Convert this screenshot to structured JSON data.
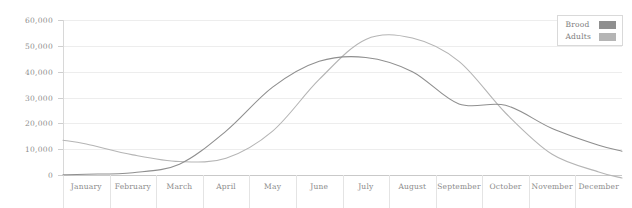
{
  "chart_data": {
    "type": "line",
    "title": "",
    "xlabel": "",
    "ylabel": "",
    "categories": [
      "January",
      "February",
      "March",
      "April",
      "May",
      "June",
      "July",
      "August",
      "September",
      "October",
      "November",
      "December"
    ],
    "ylim": [
      0,
      60000
    ],
    "ytick_labels": [
      "60,000",
      "50,000",
      "40,000",
      "30,000",
      "20,000",
      "10,000",
      "0"
    ],
    "ytick_values": [
      60000,
      50000,
      40000,
      30000,
      20000,
      10000,
      0
    ],
    "grid": true,
    "legend_position": "top-right",
    "series": [
      {
        "name": "Brood",
        "color": "#8f8f8f",
        "values": [
          300,
          900,
          4200,
          17000,
          34000,
          44000,
          45500,
          40000,
          27500,
          27000,
          18000,
          11500
        ]
      },
      {
        "name": "Adults",
        "color": "#b5b5b5",
        "values": [
          12000,
          7800,
          5200,
          6500,
          17000,
          37000,
          52500,
          53000,
          44000,
          24000,
          8000,
          1200
        ]
      }
    ]
  },
  "legend": {
    "entries": [
      {
        "label": "Brood"
      },
      {
        "label": "Adults"
      }
    ]
  },
  "colors": {
    "background": "#ffffff",
    "gridline": "#ededed",
    "axis": "#c9c9c9",
    "tick_text": "#8b8b8b",
    "brood": "#8f8f8f",
    "adults": "#b5b5b5"
  }
}
